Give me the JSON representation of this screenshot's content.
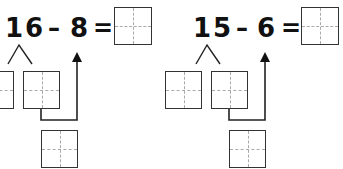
{
  "problems": [
    {
      "minuend": "16",
      "operator": "–",
      "subtrahend": "8",
      "equals": "=",
      "answer": ""
    },
    {
      "minuend": "15",
      "operator": "–",
      "subtrahend": "6",
      "equals": "=",
      "answer": ""
    }
  ]
}
